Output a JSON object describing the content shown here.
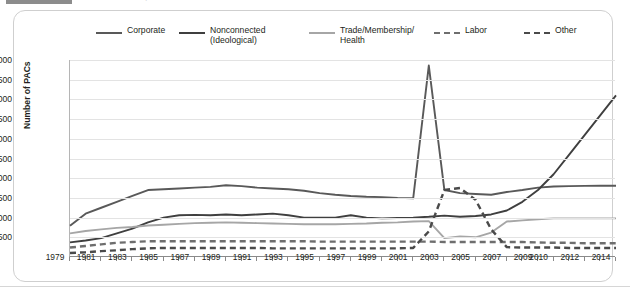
{
  "title": {
    "tab_label": "",
    "text": "Growth in PACs, 1979-2014"
  },
  "legend": [
    {
      "label": "Corporate",
      "style": "solid",
      "color": "#595959"
    },
    {
      "label": "Nonconnected\n(Ideological)",
      "style": "solid",
      "color": "#3f3f3f"
    },
    {
      "label": "Trade/Membership/\nHealth",
      "style": "solid",
      "color": "#a6a6a6"
    },
    {
      "label": "Labor",
      "style": "dash",
      "color": "#6e6e6e"
    },
    {
      "label": "Other",
      "style": "dash",
      "color": "#4a4a4a"
    }
  ],
  "axis": {
    "y_title": "Number of PACs",
    "y_ticks": [
      "500",
      "1,000",
      "1,500",
      "2,000",
      "2,500",
      "3,000",
      "3,500",
      "4,000",
      "4,500",
      "5,000"
    ],
    "x_labels": [
      "1979",
      "1981",
      "1983",
      "1985",
      "1987",
      "1989",
      "1991",
      "1993",
      "1995",
      "1997",
      "1999",
      "2001",
      "2003",
      "2005",
      "2007",
      "2009",
      "2010",
      "2012",
      "2014"
    ]
  },
  "chart_data": {
    "type": "line",
    "title": "Growth in PACs, 1979-2014",
    "xlabel": "",
    "ylabel": "Number of PACs",
    "ylim": [
      0,
      5000
    ],
    "ytick_step": 500,
    "grid": true,
    "legend_position": "top",
    "x": [
      1979,
      1980,
      1981,
      1982,
      1983,
      1984,
      1985,
      1986,
      1987,
      1988,
      1989,
      1990,
      1991,
      1992,
      1993,
      1994,
      1995,
      1996,
      1997,
      1998,
      1999,
      2000,
      2001,
      2002,
      2003,
      2004,
      2005,
      2006,
      2007,
      2008,
      2009,
      2010,
      2011,
      2012,
      2013,
      2014
    ],
    "x_tick_labels": [
      "1979",
      "",
      "1981",
      "",
      "1983",
      "",
      "1985",
      "",
      "1987",
      "",
      "1989",
      "",
      "1991",
      "",
      "1993",
      "",
      "1995",
      "",
      "1997",
      "",
      "1999",
      "",
      "2001",
      "",
      "2003",
      "",
      "2005",
      "",
      "2007",
      "",
      "2009",
      "2010",
      "",
      "2012",
      "",
      "2014"
    ],
    "series": [
      {
        "name": "Corporate",
        "color": "#595959",
        "style": "solid",
        "values": [
          790,
          1100,
          1250,
          1400,
          1550,
          1700,
          1720,
          1740,
          1760,
          1780,
          1820,
          1800,
          1760,
          1740,
          1720,
          1680,
          1620,
          1580,
          1550,
          1530,
          1520,
          1500,
          1490,
          4860,
          1700,
          1620,
          1600,
          1580,
          1650,
          1700,
          1760,
          1790,
          1800,
          1805,
          1810,
          1810
        ]
      },
      {
        "name": "Nonconnected (Ideological)",
        "color": "#3f3f3f",
        "style": "solid",
        "values": [
          370,
          420,
          480,
          600,
          720,
          880,
          1000,
          1060,
          1070,
          1060,
          1080,
          1060,
          1080,
          1100,
          1060,
          1000,
          1000,
          1000,
          1060,
          1000,
          980,
          990,
          1000,
          1020,
          1050,
          1020,
          1040,
          1080,
          1180,
          1400,
          1700,
          2100,
          2600,
          3100,
          3600,
          4100
        ]
      },
      {
        "name": "Trade/Membership/Health",
        "color": "#a6a6a6",
        "style": "solid",
        "values": [
          600,
          660,
          700,
          740,
          760,
          800,
          820,
          840,
          860,
          870,
          880,
          870,
          860,
          850,
          840,
          830,
          830,
          830,
          840,
          850,
          870,
          880,
          900,
          910,
          480,
          520,
          500,
          620,
          900,
          930,
          960,
          980,
          980,
          980,
          980,
          980
        ]
      },
      {
        "name": "Labor",
        "color": "#6e6e6e",
        "style": "dash",
        "values": [
          240,
          280,
          320,
          360,
          380,
          400,
          400,
          400,
          400,
          400,
          400,
          400,
          400,
          400,
          400,
          400,
          390,
          390,
          390,
          390,
          390,
          390,
          390,
          390,
          380,
          380,
          380,
          380,
          380,
          380,
          370,
          360,
          360,
          350,
          350,
          350
        ]
      },
      {
        "name": "Other",
        "color": "#4a4a4a",
        "style": "dash",
        "values": [
          100,
          120,
          150,
          170,
          200,
          220,
          230,
          230,
          230,
          230,
          230,
          230,
          230,
          220,
          220,
          220,
          220,
          220,
          220,
          220,
          220,
          220,
          230,
          650,
          1700,
          1750,
          1450,
          700,
          250,
          240,
          240,
          240,
          230,
          230,
          230,
          230
        ]
      }
    ]
  }
}
